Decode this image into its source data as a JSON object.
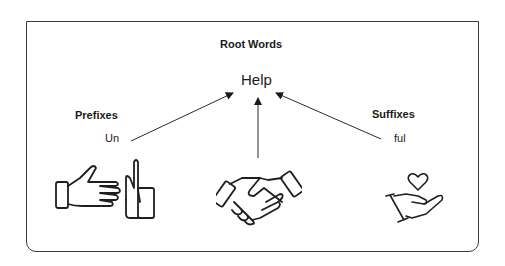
{
  "diagram": {
    "title": "Root Words",
    "root_word": "Help",
    "prefix_heading": "Prefixes",
    "prefix": "Un",
    "suffix_heading": "Suffixes",
    "suffix": "ful",
    "icons": {
      "left": "hand-stop-icon",
      "center": "handshake-icon",
      "right": "hand-holding-heart-icon"
    },
    "colors": {
      "stroke": "#2a2a2a",
      "border": "#3a3a3a",
      "background": "#ffffff"
    }
  }
}
